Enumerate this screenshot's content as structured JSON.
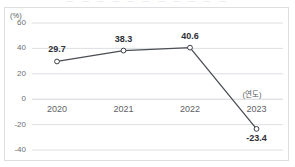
{
  "cropped_title": "ㅡ ㅡ ㅡ ㅡ ㅡ ㅡ ㅡ ㅡ ㅡ ㅡ ㅡ",
  "chart_data": {
    "type": "line",
    "title": "",
    "categories": [
      "2020",
      "2021",
      "2022",
      "2023"
    ],
    "values": [
      29.7,
      38.3,
      40.6,
      -23.4
    ],
    "series": [
      {
        "name": "",
        "values": [
          29.7,
          38.3,
          40.6,
          -23.4
        ]
      }
    ],
    "data_labels": [
      "29.7",
      "38.3",
      "40.6",
      "-23.4"
    ],
    "xlabel": "",
    "ylabel": "",
    "x_unit_label": "(연도)",
    "y_unit_label": "(%)",
    "yticks": [
      60,
      40,
      20,
      0,
      -20,
      -40
    ],
    "ytick_labels": [
      "60",
      "40",
      "20",
      "0",
      "-20",
      "-40"
    ],
    "ylim": [
      -40,
      60
    ],
    "grid": true,
    "legend": false,
    "legend_position": "none",
    "colors": {
      "line": "#4a4d53",
      "marker_fill": "#ffffff",
      "marker_stroke": "#3c3f45",
      "grid": "#d3d6da",
      "axis_text": "#6b6e73",
      "label_text": "#2d3036",
      "frame": "#dcdee1",
      "background": "#ffffff"
    }
  }
}
